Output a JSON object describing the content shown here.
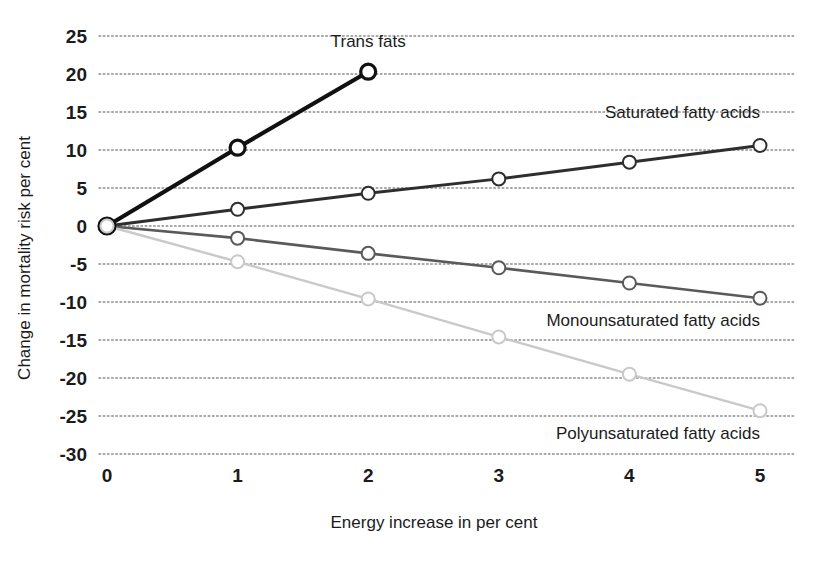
{
  "chart_data": {
    "type": "line",
    "title": "",
    "subtitle": "",
    "xlabel": "Energy increase in per cent",
    "ylabel": "Change in mortality risk per cent",
    "x": [
      0,
      1,
      2,
      3,
      4,
      5
    ],
    "xticklabels": [
      "0",
      "1",
      "2",
      "3",
      "4",
      "5"
    ],
    "yticks": [
      25,
      20,
      15,
      10,
      5,
      0,
      -5,
      -10,
      -15,
      -20,
      -25,
      -30
    ],
    "yticklabels": [
      "25",
      "20",
      "15",
      "10",
      "5",
      "0",
      "-5",
      "-10",
      "-15",
      "-20",
      "-25",
      "-30"
    ],
    "xlim": [
      0,
      5
    ],
    "ylim": [
      -30,
      25
    ],
    "grid": "horizontal-dotted",
    "legend_position": "inline-labels-at-series-end",
    "series": [
      {
        "name": "Trans fats",
        "label": "Trans fats",
        "color": "#111111",
        "x": [
          0,
          1,
          2
        ],
        "values": [
          0,
          10.3,
          20.3
        ],
        "label_x": 2,
        "label_y": 23.5,
        "label_anchor": "middle"
      },
      {
        "name": "Saturated fatty acids",
        "label": "Saturated fatty acids",
        "color": "#2e2e2e",
        "x": [
          0,
          1,
          2,
          3,
          4,
          5
        ],
        "values": [
          0,
          2.2,
          4.3,
          6.2,
          8.4,
          10.6
        ],
        "label_x": 5,
        "label_y": 14.2,
        "label_anchor": "end"
      },
      {
        "name": "Monounsaturated fatty acids",
        "label": "Monounsaturated fatty acids",
        "color": "#5a5a5a",
        "x": [
          0,
          1,
          2,
          3,
          4,
          5
        ],
        "values": [
          0,
          -1.6,
          -3.6,
          -5.5,
          -7.5,
          -9.5
        ],
        "label_x": 5,
        "label_y": -13.2,
        "label_anchor": "end"
      },
      {
        "name": "Polyunsaturated fatty acids",
        "label": "Polyunsaturated fatty acids",
        "color": "#c9c9c9",
        "x": [
          0,
          1,
          2,
          3,
          4,
          5
        ],
        "values": [
          0,
          -4.7,
          -9.6,
          -14.6,
          -19.5,
          -24.3
        ],
        "label_x": 5,
        "label_y": -28.0,
        "label_anchor": "end"
      }
    ]
  },
  "axes": {
    "x_title": "Energy increase in per cent",
    "y_title": "Change in mortality risk per cent"
  },
  "colors": {
    "background": "#ffffff",
    "grid": "#8c8c8c",
    "text": "#1b1b1b",
    "trans_fats": "#111111",
    "saturated": "#2e2e2e",
    "monounsaturated": "#5a5a5a",
    "polyunsaturated": "#c9c9c9"
  }
}
